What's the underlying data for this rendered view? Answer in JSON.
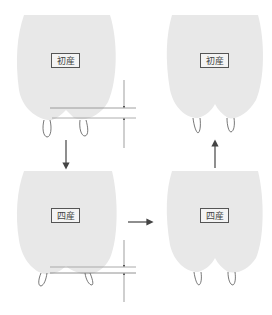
{
  "diagram": {
    "colors": {
      "udder_fill": "#e8e8e8",
      "line": "#555555",
      "measure_line_upper": "#aaaaaa",
      "measure_line_lower": "#777777",
      "background": "#ffffff"
    },
    "panels": [
      {
        "id": "top-left",
        "label": "初産",
        "state": "first calving, deep gap between quarters, teats low"
      },
      {
        "id": "top-right",
        "label": "初産",
        "state": "first calving, recovered"
      },
      {
        "id": "bottom-left",
        "label": "四産",
        "state": "fourth calving, sagging udder"
      },
      {
        "id": "bottom-right",
        "label": "四産",
        "state": "fourth calving"
      }
    ],
    "arrows": [
      {
        "from": "top-left",
        "to": "bottom-left",
        "direction": "down"
      },
      {
        "from": "bottom-left",
        "to": "bottom-right",
        "direction": "right"
      },
      {
        "from": "bottom-right",
        "to": "top-right",
        "direction": "up"
      }
    ],
    "measurements": [
      {
        "panel": "top-left",
        "type": "udder floor depth indicator"
      },
      {
        "panel": "bottom-left",
        "type": "udder floor depth indicator"
      }
    ]
  }
}
